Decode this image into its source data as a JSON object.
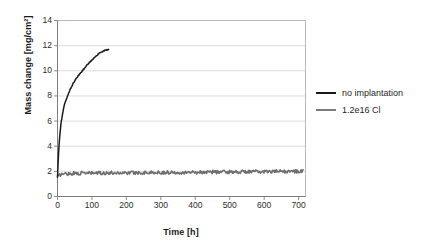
{
  "chart_data": {
    "type": "line",
    "title": "",
    "xlabel": "Time [h]",
    "ylabel": "Mass change [mg/cm²]",
    "xlim": [
      0,
      720
    ],
    "ylim": [
      0,
      14
    ],
    "xticks": [
      0,
      100,
      200,
      300,
      400,
      500,
      600,
      700
    ],
    "yticks": [
      0,
      2,
      4,
      6,
      8,
      10,
      12,
      14
    ],
    "grid": "horizontal",
    "legend_position": "right",
    "series": [
      {
        "name": "no implantation",
        "color": "#1a1a1a",
        "x": [
          0,
          2,
          4,
          7,
          10,
          14,
          18,
          23,
          28,
          34,
          40,
          47,
          55,
          63,
          72,
          82,
          92,
          103,
          115,
          128,
          141,
          150
        ],
        "values": [
          1.55,
          2.9,
          3.9,
          5.0,
          5.75,
          6.5,
          7.05,
          7.55,
          7.95,
          8.35,
          8.7,
          9.05,
          9.4,
          9.7,
          10.0,
          10.35,
          10.65,
          10.95,
          11.25,
          11.5,
          11.65,
          11.72
        ]
      },
      {
        "name": "1.2e16 Cl",
        "color": "#6e6e6e",
        "x": [
          0,
          10,
          30,
          60,
          100,
          150,
          200,
          250,
          300,
          350,
          400,
          450,
          500,
          550,
          600,
          650,
          700,
          715
        ],
        "values": [
          1.55,
          1.78,
          1.82,
          1.85,
          1.86,
          1.88,
          1.89,
          1.9,
          1.91,
          1.92,
          1.93,
          1.95,
          1.96,
          1.97,
          1.98,
          1.99,
          2.0,
          2.02
        ]
      }
    ]
  },
  "axes": {
    "ytick_labels": [
      "14",
      "12",
      "10",
      "8",
      "6",
      "4",
      "2",
      "0"
    ],
    "xtick_labels": [
      "0",
      "100",
      "200",
      "300",
      "400",
      "500",
      "600",
      "700"
    ],
    "xlabel": "Time [h]",
    "ylabel": "Mass change [mg/cm²]"
  },
  "legend": {
    "items": [
      {
        "label": "no implantation",
        "color": "#1a1a1a"
      },
      {
        "label": "1.2e16 Cl",
        "color": "#7a7a7a"
      }
    ]
  },
  "colors": {
    "plot_border": "#b9b9b9",
    "gridline": "#dcdcdc",
    "series_1": "#1a1a1a",
    "series_2": "#6e6e6e",
    "background": "#ffffff"
  }
}
